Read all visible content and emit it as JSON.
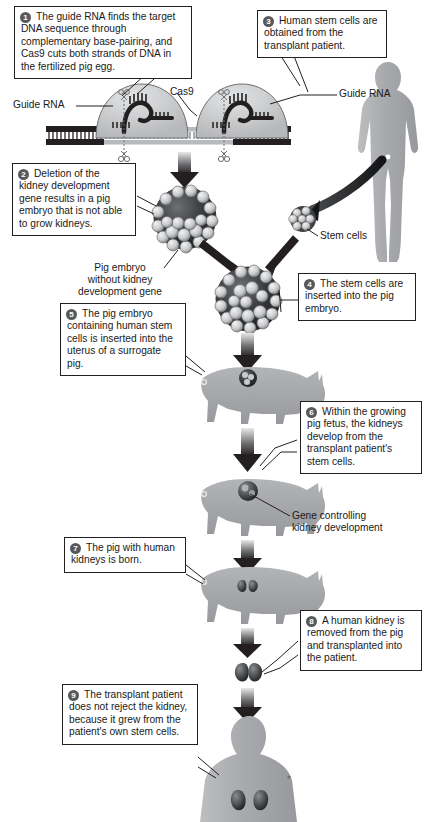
{
  "figure": {
    "background_color": "#ffffff",
    "ink_color": "#231f20",
    "badge_color": "#58595b",
    "silhouette_color": "#a7a9ac",
    "arrow_color": "#231f20"
  },
  "steps": [
    {
      "number": "1",
      "text": "The guide RNA finds the target DNA sequence through complementary base-pairing, and Cas9 cuts both strands of DNA in the fertilized pig egg."
    },
    {
      "number": "2",
      "text": "Deletion of the kidney development gene results in a pig embryo that is not able to grow kidneys."
    },
    {
      "number": "3",
      "text": "Human stem cells are obtained from the transplant patient."
    },
    {
      "number": "4",
      "text": "The stem cells are inserted into the pig embryo."
    },
    {
      "number": "5",
      "text": "The pig embryo containing human stem cells is inserted into the uterus of a surrogate pig."
    },
    {
      "number": "6",
      "text": "Within the growing pig fetus, the kidneys develop from the transplant patient's stem cells."
    },
    {
      "number": "7",
      "text": "The pig with human kidneys is born."
    },
    {
      "number": "8",
      "text": "A human kidney is removed from the pig and transplanted into the patient."
    },
    {
      "number": "9",
      "text": "The transplant patient does not reject the kidney, because it grew from the patient's own stem cells."
    }
  ],
  "labels": {
    "guide_rna_left": "Guide RNA",
    "guide_rna_right": "Guide RNA",
    "cas9": "Cas9",
    "pig_embryo_no_gene": "Pig embryo\nwithout kidney\ndevelopment gene",
    "stem_cells": "Stem cells",
    "gene_controlling": "Gene controlling\nkidney development"
  },
  "diagram_elements": [
    {
      "name": "dna-cas9-complex",
      "kind": "illustration"
    },
    {
      "name": "pig-embryo-blastocyst",
      "kind": "illustration"
    },
    {
      "name": "human-donor-figure",
      "kind": "silhouette"
    },
    {
      "name": "stem-cell-cluster",
      "kind": "illustration"
    },
    {
      "name": "chimeric-embryo",
      "kind": "illustration"
    },
    {
      "name": "surrogate-pig",
      "kind": "silhouette"
    },
    {
      "name": "pig-fetus-with-gene",
      "kind": "silhouette"
    },
    {
      "name": "newborn-pig-with-kidneys",
      "kind": "silhouette"
    },
    {
      "name": "harvested-kidney",
      "kind": "illustration"
    },
    {
      "name": "transplant-patient-figure",
      "kind": "silhouette"
    }
  ]
}
